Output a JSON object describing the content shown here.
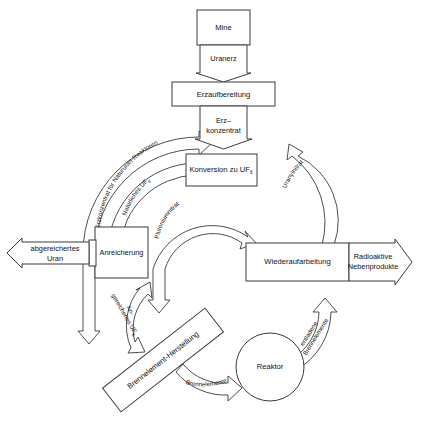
{
  "diagram": {
    "language": "de"
  },
  "nodes": {
    "mine": {
      "label": "Mine",
      "shape": "rect"
    },
    "uranerz": {
      "label": "Uranerz",
      "shape": "down-arrow"
    },
    "erzaufbereitung": {
      "label": "Erzaufbereitung",
      "shape": "rect"
    },
    "erzkonzentrat": {
      "label_line1": "Erz–",
      "label_line2": "konzentrat",
      "shape": "down-arrow"
    },
    "konversion": {
      "label_main": "Konversion zu UF",
      "label_sub": "6",
      "shape": "rect"
    },
    "anreicherung": {
      "label": "Anreicherung",
      "shape": "rect"
    },
    "wiederaufarbeitung": {
      "label": "Wiederaufarbeitung",
      "shape": "rect"
    },
    "reaktor": {
      "label": "Reaktor",
      "shape": "circle"
    },
    "brennelement_herstellung": {
      "label": "Brennelement-Herstellung",
      "shape": "rotated-rect"
    },
    "abgereichertes_uran": {
      "label_line1": "abgereichertes",
      "label_line2": "Uran",
      "shape": "left-arrow"
    },
    "radioaktive_nebenprodukte": {
      "label_line1": "Radioaktive",
      "label_line2": "Nebenprodukte",
      "shape": "right-arrow"
    }
  },
  "flows": {
    "erzkonzentrat_natururan": {
      "label": "Erzkonzentrat für Natururan-Reaktoren"
    },
    "natuerliches_uf6": {
      "label_main": "Natürliches UF",
      "label_sub": "6"
    },
    "plutoniumnitrat": {
      "label": "Plutoniumnitrat"
    },
    "angereichertes_uf6": {
      "label_line1": "An-",
      "label_line2": "gereichertes UF",
      "label_sub": "6"
    },
    "uranylnitrat": {
      "label": "Uranylnitrat"
    },
    "brennelemente": {
      "label": "Brennelemente"
    },
    "entladene_brennelemente": {
      "label_line1": "entladene",
      "label_line2": "Brennelemente"
    }
  },
  "colors": {
    "stroke": "#3a3a3a",
    "fill": "#ffffff",
    "text": "#111111",
    "background": "#ffffff"
  }
}
